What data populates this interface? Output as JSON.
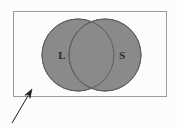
{
  "figure": {
    "type": "venn-diagram",
    "background_color": "#fcfcfc",
    "frame": {
      "name": "universal-set-rectangle",
      "x": 13,
      "y": 11,
      "width": 154,
      "height": 86,
      "stroke_color": "#9a9a9a",
      "stroke_width": 1,
      "fill": "none"
    },
    "sets": [
      {
        "label": "L",
        "name": "set-circle-left",
        "cx": 78,
        "cy": 55,
        "r": 36,
        "fill_color": "#8a8a8a",
        "stroke_color": "#5e5e5e",
        "label_x": 62,
        "label_y": 56
      },
      {
        "label": "S",
        "name": "set-circle-right",
        "cx": 105,
        "cy": 55,
        "r": 36,
        "fill_color": "#8a8a8a",
        "stroke_color": "#5e5e5e",
        "label_x": 122,
        "label_y": 56
      }
    ],
    "pointer": {
      "name": "annotation-arrow",
      "tail_x": 12,
      "tail_y": 123,
      "tip_x": 32,
      "tip_y": 89,
      "color": "#1a1a1a",
      "stroke_width": 1,
      "head_length": 9,
      "head_width": 6
    },
    "ghost_text": {
      "value": "",
      "x": 10,
      "y": 116,
      "color": "#f2f2f2"
    }
  }
}
